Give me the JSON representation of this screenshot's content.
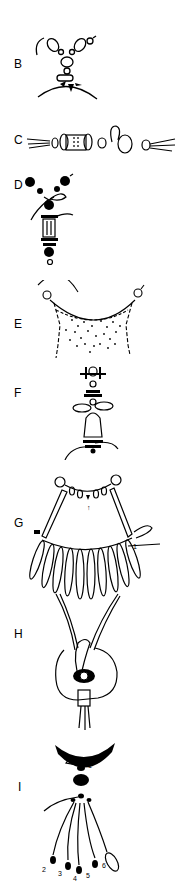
{
  "figure": {
    "panels": [
      {
        "id": "B",
        "label": "B",
        "description": "Y-shaped bead strand with crimp loop at center"
      },
      {
        "id": "C",
        "label": "C",
        "description": "Horizontal cord with spool bead and rings"
      },
      {
        "id": "D",
        "label": "D",
        "description": "Dark beads with cylindrical bead pendant and tied cord"
      },
      {
        "id": "E",
        "label": "E",
        "description": "Curved bead-edged netted bib"
      },
      {
        "id": "F",
        "label": "F",
        "description": "Stacked discs with bell-shaped bead and cord loops"
      },
      {
        "id": "G",
        "label": "G",
        "description": "Two-tier fringe collar with long drop beads",
        "step_labels": [
          "1",
          "1"
        ]
      },
      {
        "id": "H",
        "label": "H",
        "description": "Large disc bead with cord loop and tube bead"
      },
      {
        "id": "I",
        "label": "I",
        "description": "Crescent pendant with tassel of beaded strands",
        "step_labels": [
          "1",
          "2",
          "3",
          "4",
          "5",
          "6"
        ]
      }
    ]
  },
  "colors": {
    "ink": "#000000",
    "paper": "#ffffff"
  }
}
